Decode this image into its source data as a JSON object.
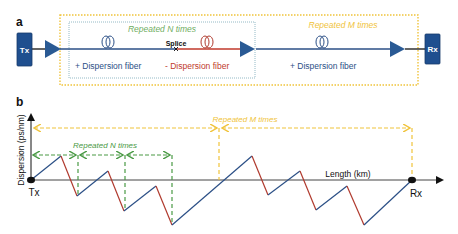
{
  "panel_a": {
    "label": "a",
    "tx_label": "Tx",
    "rx_label": "Rx",
    "repeat_n_label": "Repeated N times",
    "repeat_m_label": "Repeated M times",
    "splice_label": "Splice",
    "fiber_pos_label_1": "+ Dispersion fiber",
    "fiber_neg_label": "- Dispersion fiber",
    "fiber_pos_label_2": "+ Dispersion fiber",
    "icons": [
      "amplifier-triangle",
      "fiber-coil",
      "splice-x"
    ]
  },
  "panel_b": {
    "label": "b",
    "y_axis_label": "Dispersion (ps/nm)",
    "x_axis_label": "Length (km)",
    "tx_label": "Tx",
    "rx_label": "Rx",
    "repeat_n_label": "Repeated N times",
    "repeat_m_label": "Repeated M times"
  },
  "colors": {
    "blue": "#2b4f86",
    "red": "#b03a2e",
    "green": "#4a9a45",
    "orange": "#f0c33a",
    "box_blue": "#1f4f8f",
    "axis": "#333333"
  }
}
